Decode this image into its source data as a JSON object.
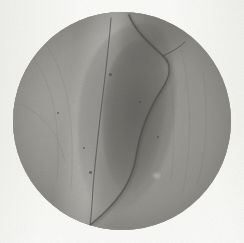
{
  "figure": {
    "kind": "photomicrograph",
    "caption": "",
    "colors": {
      "page_background": "#f8f8f6",
      "field_background": "#93928d",
      "field_light_tissue": "#a3a29d",
      "field_dark_structure": "#6e6d69",
      "fissure": "#464542",
      "field_edge": "#84837e"
    },
    "field_of_view": {
      "shape": "circle",
      "center_x": 122,
      "center_y": 121,
      "diameter": 218
    },
    "features": [
      {
        "name": "left-tissue-mass",
        "tone": "mid-gray",
        "position": "left"
      },
      {
        "name": "pale-diagonal-band",
        "tone": "light-gray",
        "position": "upper-left-of-center"
      },
      {
        "name": "central-lens-structure",
        "tone": "dark-gray",
        "position": "center"
      },
      {
        "name": "upper-wedge",
        "tone": "dark-gray",
        "position": "upper-right-of-center"
      },
      {
        "name": "vertical-fissure",
        "tone": "near-black",
        "position": "center-running-top-to-bottom"
      },
      {
        "name": "right-tissue-field",
        "tone": "mid-gray",
        "position": "right"
      }
    ]
  }
}
